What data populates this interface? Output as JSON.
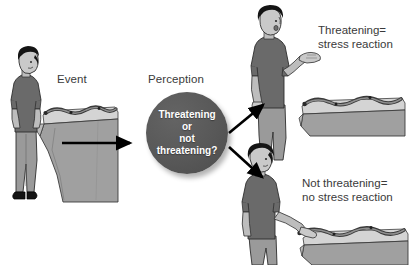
{
  "diagram": {
    "background_color": "#ffffff",
    "stages": {
      "event_label": "Event",
      "perception_label": "Perception"
    },
    "perception_circle": {
      "fill_color": "#585858",
      "text_color": "#ffffff",
      "lines": [
        "Threatening",
        "or",
        "not",
        "threatening?"
      ]
    },
    "outcomes": [
      {
        "id": "threatening",
        "line1": "Threatening=",
        "line2": "stress reaction"
      },
      {
        "id": "not-threatening",
        "line1": "Not threatening=",
        "line2": "no stress reaction"
      }
    ],
    "arrows": [
      {
        "id": "event-to-perception",
        "direction": "right",
        "color": "#000000"
      },
      {
        "id": "perception-to-threatening",
        "direction": "up-right",
        "color": "#000000"
      },
      {
        "id": "perception-to-not-threatening",
        "direction": "down-right",
        "color": "#000000"
      }
    ],
    "illustrations": [
      {
        "id": "event-scene",
        "description": "Man looking down at a snake on a rocky ledge",
        "shirt_color": "#6a6a6a",
        "pants_color": "#9a9a9a",
        "hair_color": "#1a1a1a",
        "rock_color": "#a0a0a0"
      },
      {
        "id": "stress-reaction-scene",
        "description": "Startled man recoiling with raised hand from snake on ledge",
        "shirt_color": "#6a6a6a",
        "pants_color": "#9a9a9a",
        "hair_color": "#1a1a1a",
        "rock_color": "#a0a0a0"
      },
      {
        "id": "no-stress-reaction-scene",
        "description": "Calm man reaching out to touch snake on ledge",
        "shirt_color": "#6a6a6a",
        "pants_color": "#9a9a9a",
        "hair_color": "#1a1a1a",
        "rock_color": "#a0a0a0"
      }
    ]
  }
}
